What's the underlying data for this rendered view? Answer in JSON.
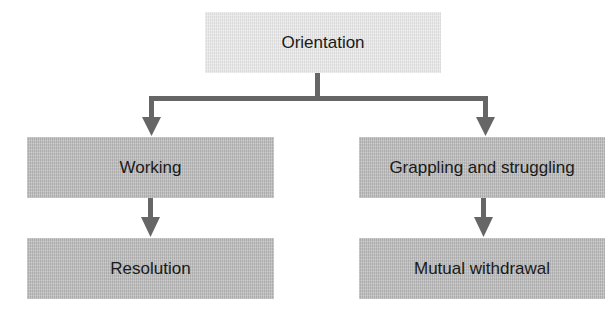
{
  "diagram": {
    "type": "flowchart",
    "nodes": {
      "root": {
        "label": "Orientation"
      },
      "left_1": {
        "label": "Working"
      },
      "left_2": {
        "label": "Resolution"
      },
      "right_1": {
        "label": "Grappling and struggling"
      },
      "right_2": {
        "label": "Mutual withdrawal"
      }
    },
    "edges": [
      {
        "from": "Orientation",
        "to": "Working"
      },
      {
        "from": "Orientation",
        "to": "Grappling and struggling"
      },
      {
        "from": "Working",
        "to": "Resolution"
      },
      {
        "from": "Grappling and struggling",
        "to": "Mutual withdrawal"
      }
    ],
    "colors": {
      "root_fill": "#e6e6e6",
      "node_fill": "#b9b9b9",
      "connector": "#666666",
      "text": "#1a1a1a"
    }
  }
}
